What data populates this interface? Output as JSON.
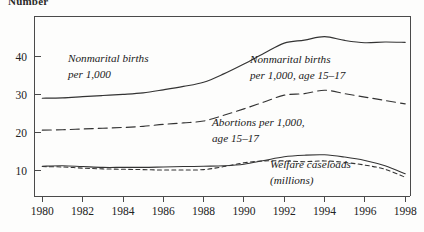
{
  "figure": {
    "top_label": "Number",
    "background_color": "#fdfdfc",
    "axis_color": "#4a4a4a",
    "line_color": "#333333"
  },
  "annotations": {
    "nonmarital_births_line1": "Nonmarital births",
    "nonmarital_births_line2": "per 1,000",
    "nonmarital_births_teen_line1": "Nonmarital births",
    "nonmarital_births_teen_line2": "per 1,000, age 15–17",
    "abortions_line1": "Abortions per 1,000,",
    "abortions_line2": "age 15–17",
    "welfare_line1": "Welfare caseloads",
    "welfare_line2": "(millions)"
  },
  "chart_data": {
    "type": "line",
    "title": "",
    "subtitle": "",
    "xlabel": "",
    "ylabel": "Number",
    "xlim": [
      1980,
      1998
    ],
    "ylim": [
      0,
      48
    ],
    "grid": false,
    "legend_position": "inline-annotations",
    "x_ticks": [
      1980,
      1982,
      1984,
      1986,
      1988,
      1990,
      1992,
      1994,
      1996,
      1998
    ],
    "x_tick_labels": [
      "1980",
      "1982",
      "1984",
      "1986",
      "1988",
      "1990",
      "1992",
      "1994",
      "1996",
      "1998"
    ],
    "x_minor_ticks": [
      1981,
      1983,
      1985,
      1987,
      1989,
      1991,
      1993,
      1995,
      1997
    ],
    "y_ticks": [
      10,
      20,
      30,
      40
    ],
    "y_tick_labels": [
      "10",
      "20",
      "30",
      "40"
    ],
    "x": [
      1980,
      1981,
      1982,
      1983,
      1984,
      1985,
      1986,
      1987,
      1988,
      1989,
      1990,
      1991,
      1992,
      1993,
      1994,
      1995,
      1996,
      1997,
      1998
    ],
    "series": [
      {
        "name": "Nonmarital births per 1,000",
        "style": "solid",
        "values": [
          29.0,
          29.1,
          29.4,
          29.7,
          30.0,
          30.4,
          31.2,
          32.1,
          33.2,
          35.4,
          38.0,
          40.8,
          43.5,
          44.3,
          45.2,
          44.2,
          43.6,
          43.8,
          43.7
        ]
      },
      {
        "name": "Nonmarital births per 1,000, age 15–17",
        "style": "long-dash",
        "values": [
          20.6,
          20.7,
          20.9,
          21.1,
          21.3,
          21.6,
          22.1,
          22.5,
          23.0,
          24.5,
          26.2,
          28.0,
          29.8,
          30.2,
          31.1,
          30.2,
          29.3,
          28.4,
          27.5
        ]
      },
      {
        "name": "Abortions per 1,000, age 15–17",
        "style": "short-dash",
        "values": [
          11.0,
          10.9,
          10.6,
          10.4,
          10.3,
          10.2,
          10.1,
          10.1,
          10.2,
          11.0,
          12.0,
          12.5,
          12.5,
          12.3,
          12.5,
          12.1,
          11.4,
          10.3,
          8.2
        ]
      },
      {
        "name": "Welfare caseloads (millions)",
        "style": "solid",
        "values": [
          11.1,
          11.2,
          11.0,
          10.8,
          10.8,
          10.8,
          10.9,
          11.0,
          11.1,
          11.2,
          11.6,
          12.6,
          13.6,
          14.0,
          14.1,
          13.5,
          12.6,
          11.2,
          9.1
        ]
      }
    ]
  }
}
